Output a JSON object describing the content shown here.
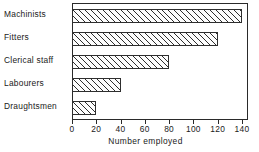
{
  "chart_data": {
    "type": "bar",
    "orientation": "horizontal",
    "title": "",
    "xlabel": "Number employed",
    "ylabel": "",
    "categories": [
      "Machinists",
      "Fitters",
      "Clerical staff",
      "Labourers",
      "Draughtsmen"
    ],
    "values": [
      140,
      120,
      80,
      40,
      20
    ],
    "xlim": [
      0,
      145
    ],
    "xticks": [
      0,
      20,
      40,
      60,
      80,
      100,
      120,
      140
    ],
    "xtick_labels": [
      "0",
      "20",
      "40",
      "60",
      "80",
      "100",
      "120",
      "140"
    ],
    "grid": false,
    "legend": null,
    "bar_style": {
      "fill": "diagonal-hatch",
      "edge_color": "#2e2e2e",
      "face_color": "#ffffff"
    }
  },
  "axis": {
    "x_title": "Number employed"
  }
}
